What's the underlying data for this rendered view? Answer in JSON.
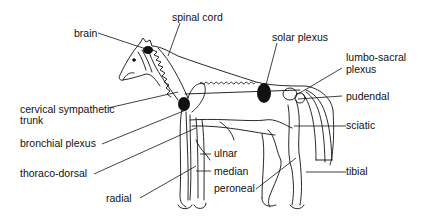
{
  "diagram": {
    "labels": {
      "brain": "brain",
      "spinal_cord": "spinal cord",
      "solar_plexus": "solar plexus",
      "lumbo_sacral_plexus_1": "lumbo-sacral",
      "lumbo_sacral_plexus_2": "plexus",
      "pudendal": "pudendal",
      "cervical_sympathetic_trunk_1": "cervical sympathetic",
      "cervical_sympathetic_trunk_2": "trunk",
      "bronchial_plexus": "bronchial plexus",
      "sciatic": "sciatic",
      "ulnar": "ulnar",
      "median": "median",
      "thoraco_dorsal": "thoraco-dorsal",
      "peroneal": "peroneal",
      "tibial": "tibial",
      "radial": "radial"
    },
    "colors": {
      "line": "#111111",
      "ganglion": "#111111",
      "background": "#ffffff"
    }
  }
}
